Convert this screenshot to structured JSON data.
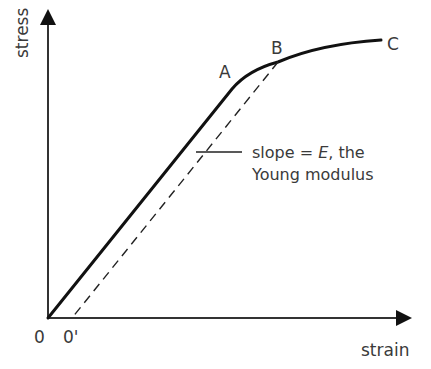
{
  "diagram": {
    "type": "stress-strain curve",
    "axes": {
      "y_label": "stress",
      "x_label": "strain"
    },
    "points": {
      "origin": "0",
      "offset_origin": "0'",
      "A": "A",
      "B": "B",
      "C": "C"
    },
    "annotation": {
      "line1_prefix": "slope = ",
      "line1_symbol": "E",
      "line1_suffix": ", the",
      "line2": "Young modulus"
    },
    "colors": {
      "curve": "#111111",
      "axes": "#333333",
      "text": "#3a3a3a"
    }
  }
}
